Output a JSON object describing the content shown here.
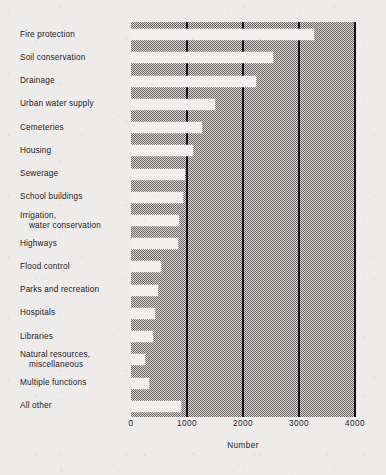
{
  "chart_data": {
    "type": "bar",
    "orientation": "horizontal",
    "title": "",
    "xlabel": "Number",
    "ylabel": "",
    "xlim": [
      0,
      4000
    ],
    "xticks": [
      0,
      1000,
      2000,
      3000,
      4000
    ],
    "xtick_labels": [
      "0",
      "1000",
      "2000",
      "3000",
      "4000"
    ],
    "grid": true,
    "gridlines_at": [
      1000,
      2000,
      3000,
      4000
    ],
    "legend": "none",
    "categories": [
      "Fire protection",
      "Soil conservation",
      "Drainage",
      "Urban water supply",
      "Cemeteries",
      "Housing",
      "Sewerage",
      "School buildings",
      "Irrigation, water conservation",
      "Highways",
      "Flood control",
      "Parks and recreation",
      "Hospitals",
      "Libraries",
      "Natural resources, miscellaneous",
      "Multiple functions",
      "All other"
    ],
    "values": [
      3270,
      2540,
      2230,
      1500,
      1270,
      1110,
      960,
      930,
      850,
      840,
      540,
      480,
      430,
      390,
      250,
      320,
      890
    ],
    "bar_color": "#f2f0ee",
    "plot_background": "#9a9896",
    "axis_color": "#15151a"
  },
  "category_labels": [
    {
      "line1": "Fire protection",
      "line2": ""
    },
    {
      "line1": "Soil conservation",
      "line2": ""
    },
    {
      "line1": "Drainage",
      "line2": ""
    },
    {
      "line1": "Urban water supply",
      "line2": ""
    },
    {
      "line1": "Cemeteries",
      "line2": ""
    },
    {
      "line1": "Housing",
      "line2": ""
    },
    {
      "line1": "Sewerage",
      "line2": ""
    },
    {
      "line1": "School buildings",
      "line2": ""
    },
    {
      "line1": "Irrigation,",
      "line2": "water conservation"
    },
    {
      "line1": "Highways",
      "line2": ""
    },
    {
      "line1": "Flood control",
      "line2": ""
    },
    {
      "line1": "Parks and recreation",
      "line2": ""
    },
    {
      "line1": "Hospitals",
      "line2": ""
    },
    {
      "line1": "Libraries",
      "line2": ""
    },
    {
      "line1": "Natural resources,",
      "line2": "miscellaneous"
    },
    {
      "line1": "Multiple functions",
      "line2": ""
    },
    {
      "line1": "All other",
      "line2": ""
    }
  ],
  "axis": {
    "x_title": "Number",
    "tick_labels": [
      "0",
      "1000",
      "2000",
      "3000",
      "4000"
    ]
  }
}
